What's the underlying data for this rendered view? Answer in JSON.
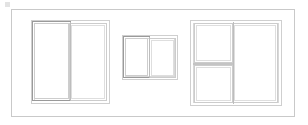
{
  "document": {
    "type": "technical-elevation-drawing",
    "subject": "window-schedule-elevations",
    "background_color": "#ffffff",
    "line_color": "#c9c9c9",
    "accent_line_color": "#9a9a9a"
  },
  "sheet": {
    "border_label": "",
    "corner_mark_label": ""
  },
  "elevations": [
    {
      "id": "window-left",
      "name": "sliding-window-left",
      "label": "",
      "panels": 2,
      "operable_panel": "left",
      "divisions": {
        "vertical_mullions": 1,
        "horizontal_rails": 0
      }
    },
    {
      "id": "window-middle",
      "name": "sliding-window-middle",
      "label": "",
      "panels": 2,
      "operable_panel": "left",
      "divisions": {
        "vertical_mullions": 1,
        "horizontal_rails": 0
      }
    },
    {
      "id": "window-right",
      "name": "sliding-window-right",
      "label": "",
      "panels": 2,
      "operable_panel": "left",
      "divisions": {
        "vertical_mullions": 1,
        "horizontal_rails": 1
      }
    }
  ]
}
